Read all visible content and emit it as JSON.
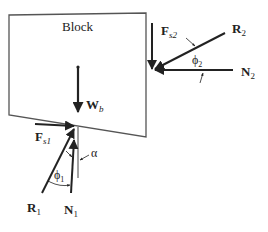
{
  "diagram": {
    "block_label": "Block",
    "forces": {
      "weight": {
        "symbol": "W",
        "subscript": "b"
      },
      "friction_1": {
        "symbol": "F",
        "subscript": "s1"
      },
      "friction_2": {
        "symbol": "F",
        "subscript": "s2"
      },
      "resultant_1": {
        "symbol": "R",
        "subscript": "1"
      },
      "resultant_2": {
        "symbol": "R",
        "subscript": "2"
      },
      "normal_1": {
        "symbol": "N",
        "subscript": "1"
      },
      "normal_2": {
        "symbol": "N",
        "subscript": "2"
      }
    },
    "angles": {
      "phi_1": {
        "symbol": "ϕ",
        "subscript": "1"
      },
      "phi_2": {
        "symbol": "ϕ",
        "subscript": "2"
      },
      "alpha": {
        "symbol": "α"
      }
    },
    "colors": {
      "line": "#222222",
      "block_edge": "#555555"
    }
  }
}
